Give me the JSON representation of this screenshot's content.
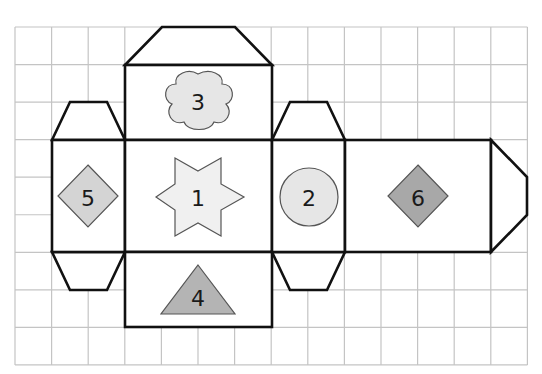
{
  "diagram": {
    "type": "cube-net",
    "grid": {
      "origin_x": 15,
      "origin_y": 27,
      "cols": 14,
      "rows": 9,
      "cell_w": 36.6,
      "cell_h": 37.55,
      "line_color": "#c4c4c4"
    },
    "outline_color": "#111111",
    "faces": [
      {
        "id": "face-1",
        "label": "1",
        "symbol": "six-point-star",
        "fill": "#f0f0f0"
      },
      {
        "id": "face-2",
        "label": "2",
        "symbol": "circle",
        "fill": "#e6e6e6"
      },
      {
        "id": "face-3",
        "label": "3",
        "symbol": "cloud",
        "fill": "#e6e6e6"
      },
      {
        "id": "face-4",
        "label": "4",
        "symbol": "triangle",
        "fill": "#b4b4b4"
      },
      {
        "id": "face-5",
        "label": "5",
        "symbol": "diamond",
        "fill": "#d4d4d4"
      },
      {
        "id": "face-6",
        "label": "6",
        "symbol": "diamond",
        "fill": "#a8a8a8"
      }
    ]
  }
}
